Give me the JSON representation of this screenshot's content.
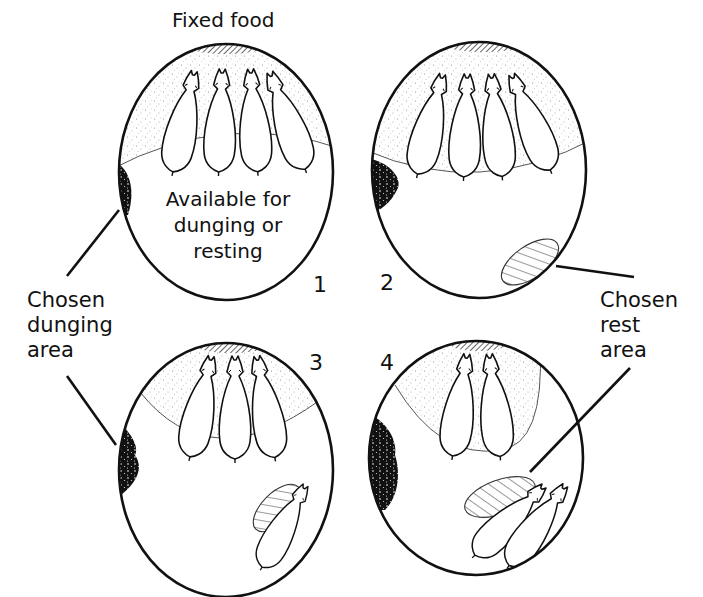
{
  "title": "Fixed food",
  "panels": [
    {
      "number": "1",
      "pigs_at_food": 4,
      "pigs_resting": 0,
      "center_label": [
        "Available for",
        "dunging or",
        "resting"
      ]
    },
    {
      "number": "2",
      "pigs_at_food": 4,
      "pigs_resting": 0
    },
    {
      "number": "3",
      "pigs_at_food": 3,
      "pigs_resting": 1
    },
    {
      "number": "4",
      "pigs_at_food": 2,
      "pigs_resting": 2
    }
  ],
  "labels": {
    "dunging": [
      "Chosen",
      "dunging",
      "area"
    ],
    "rest": [
      "Chosen",
      "rest",
      "area"
    ]
  },
  "colors": {
    "ink": "#111111",
    "background": "#ffffff",
    "stipple": "#9a9a9a"
  }
}
